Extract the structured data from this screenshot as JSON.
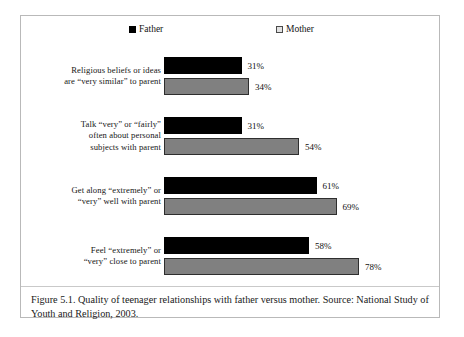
{
  "figure": {
    "caption": "Figure 5.1. Quality of teenager relationships with father versus mother. Source: National Study of Youth and Religion, 2003."
  },
  "legend": {
    "father": {
      "label": "Father",
      "icon": "filled-square-icon",
      "color": "#000000"
    },
    "mother": {
      "label": "Mother",
      "icon": "outlined-square-icon",
      "color": "#808080"
    }
  },
  "chart_data": {
    "type": "bar",
    "orientation": "horizontal",
    "title": "",
    "xlabel": "",
    "ylabel": "",
    "xlim": [
      0,
      100
    ],
    "grid": false,
    "legend_position": "top",
    "value_suffix": "%",
    "categories": [
      "Religious beliefs or ideas are “very similar” to parent",
      "Talk “very” or “fairly” often about personal subjects with parent",
      "Get along “extremely” or “very” well with parent",
      "Feel “extremely” or “very” close to parent"
    ],
    "category_lines": [
      [
        "Religious beliefs or ideas",
        "are “very similar” to parent"
      ],
      [
        "Talk “very” or “fairly”",
        "often about personal",
        "subjects with parent"
      ],
      [
        "Get along “extremely” or",
        "“very” well with parent"
      ],
      [
        "Feel “extremely” or",
        "“very” close to parent"
      ]
    ],
    "series": [
      {
        "name": "Father",
        "values": [
          31,
          31,
          61,
          58
        ],
        "labels": [
          "31%",
          "31%",
          "61%",
          "58%"
        ],
        "color": "#000000"
      },
      {
        "name": "Mother",
        "values": [
          34,
          54,
          69,
          78
        ],
        "labels": [
          "34%",
          "54%",
          "69%",
          "78%"
        ],
        "color": "#808080"
      }
    ]
  }
}
